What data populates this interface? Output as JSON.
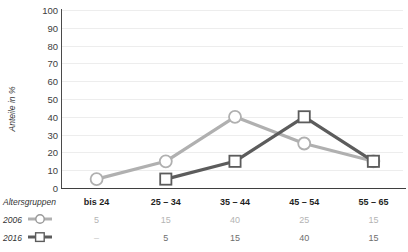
{
  "chart_data": {
    "type": "line",
    "title": "",
    "xlabel": "Altersgruppen",
    "ylabel": "Anteile in %",
    "ylim": [
      0,
      100
    ],
    "grid": true,
    "legend_position": "bottom-left",
    "categories": [
      "bis 24",
      "25 – 34",
      "35 – 44",
      "45 – 54",
      "55 – 65"
    ],
    "yticks": [
      "100",
      "90",
      "80",
      "70",
      "60",
      "50",
      "40",
      "30",
      "20",
      "10",
      "0"
    ],
    "series": [
      {
        "name": "2006",
        "marker": "circle",
        "color": "#b0b0b0",
        "values": [
          5,
          15,
          40,
          25,
          15
        ],
        "labels": [
          "5",
          "15",
          "40",
          "25",
          "15"
        ]
      },
      {
        "name": "2016",
        "marker": "square",
        "color": "#5c5c5c",
        "values": [
          null,
          5,
          15,
          40,
          15
        ],
        "labels": [
          "–",
          "5",
          "15",
          "40",
          "15"
        ]
      }
    ]
  },
  "table": {
    "header_label": "Altersgruppen",
    "rows": [
      {
        "label": "2006",
        "marker": "circle-legend-marker"
      },
      {
        "label": "2016",
        "marker": "square-legend-marker"
      }
    ]
  }
}
